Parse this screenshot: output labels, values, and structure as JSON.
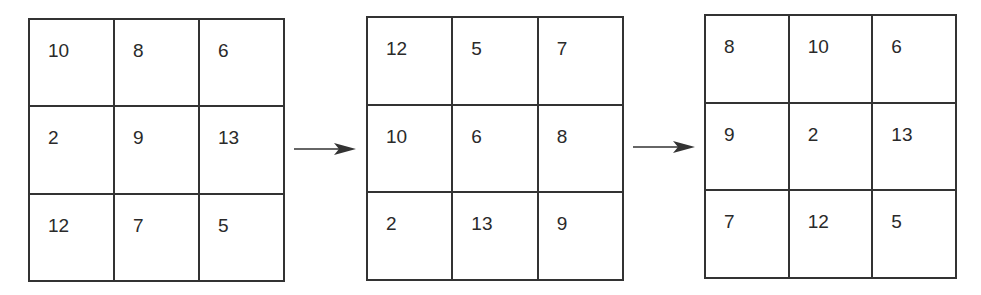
{
  "diagram": {
    "grids": [
      {
        "name": "grid-1",
        "rows": [
          [
            "10",
            "8",
            "6"
          ],
          [
            "2",
            "9",
            "13"
          ],
          [
            "12",
            "7",
            "5"
          ]
        ]
      },
      {
        "name": "grid-2",
        "rows": [
          [
            "12",
            "5",
            "7"
          ],
          [
            "10",
            "6",
            "8"
          ],
          [
            "2",
            "13",
            "9"
          ]
        ]
      },
      {
        "name": "grid-3",
        "rows": [
          [
            "8",
            "10",
            "6"
          ],
          [
            "9",
            "2",
            "13"
          ],
          [
            "7",
            "12",
            "5"
          ]
        ]
      }
    ],
    "arrows": [
      {
        "from": "grid-1",
        "to": "grid-2",
        "icon": "right-arrow-icon"
      },
      {
        "from": "grid-2",
        "to": "grid-3",
        "icon": "right-arrow-icon"
      }
    ],
    "colors": {
      "line": "#333333",
      "text": "#2a2a2a",
      "background": "#ffffff"
    }
  }
}
